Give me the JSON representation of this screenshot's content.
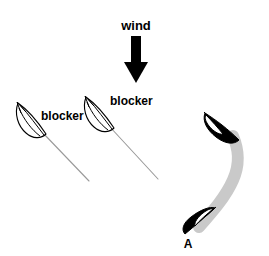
{
  "figure": {
    "type": "sailing-tactics-diagram",
    "background_color": "#ffffff",
    "width": 269,
    "height": 256
  },
  "labels": {
    "wind": "wind",
    "blocker_left": "blocker",
    "blocker_right": "blocker",
    "boat_a": "A"
  },
  "colors": {
    "ink": "#000000",
    "wake_thin": "#9a9a9a",
    "wake_thick": "#c9c9c9",
    "hull_fill_white": "#ffffff",
    "hull_fill_black": "#000000"
  },
  "elements": {
    "wind_arrow": {
      "name": "wind-arrow",
      "direction": "down",
      "shaft_x": 136,
      "shaft_top_y": 36,
      "shaft_bottom_y": 62,
      "tip_y": 82
    },
    "blocker_boats": [
      {
        "name": "blocker-boat-left",
        "hull_style": "outline",
        "heading": "up-left",
        "bow_x": 17,
        "bow_y": 102,
        "stern_x": 44,
        "stern_y": 137,
        "wake_end_x": 88,
        "wake_end_y": 180
      },
      {
        "name": "blocker-boat-right",
        "hull_style": "outline",
        "heading": "up-left",
        "bow_x": 85,
        "bow_y": 96,
        "stern_x": 111,
        "stern_y": 130,
        "wake_end_x": 158,
        "wake_end_y": 178
      }
    ],
    "boat_a_positions": [
      {
        "name": "boat-a-upper",
        "hull_style": "solid",
        "heading": "up-left",
        "bow_x": 205,
        "bow_y": 113,
        "stern_x": 238,
        "stern_y": 140
      },
      {
        "name": "boat-a-lower",
        "hull_style": "solid",
        "heading": "up-right",
        "bow_x": 213,
        "bow_y": 209,
        "stern_x": 183,
        "stern_y": 234
      }
    ],
    "boat_a_wake": {
      "name": "boat-a-curved-wake",
      "shape": "s-curve",
      "style": "thick-gray",
      "from": [
        200,
        228
      ],
      "to": [
        233,
        134
      ]
    }
  }
}
